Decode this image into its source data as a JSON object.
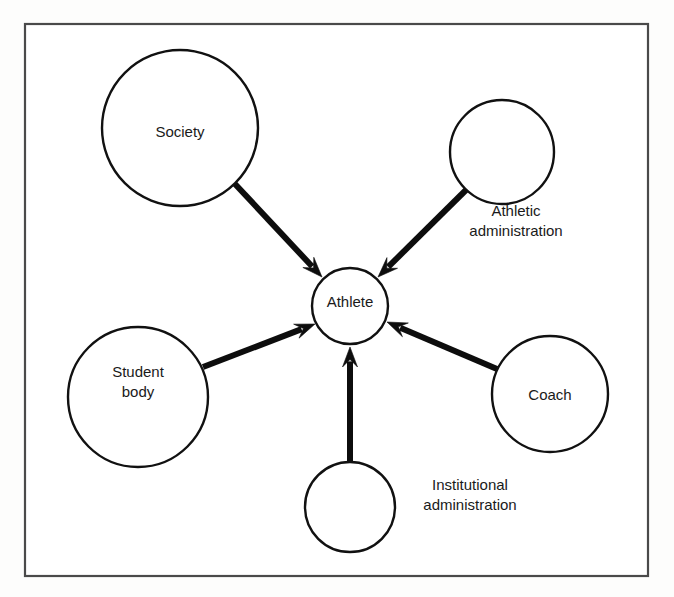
{
  "page": {
    "title": "Athlete Influence Diagram",
    "background_color": "#fdfdfc",
    "width": 674,
    "height": 597
  },
  "frame": {
    "name": "figure-border",
    "x": 25,
    "y": 24,
    "width": 623,
    "height": 552,
    "stroke_color": "#4a4a4a"
  },
  "chart_data": {
    "type": "diagram",
    "subtype": "hub-and-spoke influence diagram",
    "title": "Athlete Influence Diagram",
    "center_node": "Athlete",
    "nodes": [
      {
        "id": "society",
        "label": "Society",
        "label_lines": [
          "Society"
        ],
        "cx": 180,
        "cy": 128,
        "r": 78,
        "label_x": 180,
        "label_y": 133,
        "label_position": "inside"
      },
      {
        "id": "athletic-administration",
        "label": "Athletic administration",
        "label_lines": [
          "Athletic",
          "administration"
        ],
        "cx": 502,
        "cy": 152,
        "r": 52,
        "label_x": 516,
        "label_y": 222,
        "label_position": "outside-below-right"
      },
      {
        "id": "athlete",
        "label": "Athlete",
        "label_lines": [
          "Athlete"
        ],
        "cx": 350,
        "cy": 306,
        "r": 38,
        "label_x": 350,
        "label_y": 303,
        "label_position": "inside"
      },
      {
        "id": "student-body",
        "label": "Student body",
        "label_lines": [
          "Student",
          "body"
        ],
        "cx": 138,
        "cy": 397,
        "r": 70,
        "label_x": 138,
        "label_y": 383,
        "label_position": "inside"
      },
      {
        "id": "coach",
        "label": "Coach",
        "label_lines": [
          "Coach"
        ],
        "cx": 550,
        "cy": 394,
        "r": 58,
        "label_x": 550,
        "label_y": 396,
        "label_position": "inside"
      },
      {
        "id": "institutional-administration",
        "label": "Institutional administration",
        "label_lines": [
          "Institutional",
          "administration"
        ],
        "cx": 350,
        "cy": 507,
        "r": 45,
        "label_x": 470,
        "label_y": 496,
        "label_position": "outside-right"
      }
    ],
    "edges": [
      {
        "id": "society-to-athlete",
        "from": "society",
        "to": "athlete",
        "direction": "to-center",
        "x1": 235,
        "y1": 184,
        "x2": 322,
        "y2": 277
      },
      {
        "id": "athletic-administration-to-athlete",
        "from": "athletic-administration",
        "to": "athlete",
        "direction": "to-center",
        "x1": 466,
        "y1": 190,
        "x2": 378,
        "y2": 277
      },
      {
        "id": "student-body-to-athlete",
        "from": "student-body",
        "to": "athlete",
        "direction": "to-center",
        "x1": 203,
        "y1": 367,
        "x2": 315,
        "y2": 324
      },
      {
        "id": "coach-to-athlete",
        "from": "coach",
        "to": "athlete",
        "direction": "to-center",
        "x1": 497,
        "y1": 369,
        "x2": 387,
        "y2": 322
      },
      {
        "id": "institutional-administration-to-athlete",
        "from": "institutional-administration",
        "to": "athlete",
        "direction": "to-center",
        "x1": 350,
        "y1": 462,
        "x2": 350,
        "y2": 347
      }
    ],
    "styling": {
      "node_fill": "#ffffff",
      "node_stroke": "#111111",
      "arrow_color": "#0d0d0d",
      "text_color": "#1a1a1a",
      "arrow_width": 6,
      "font_size": 15
    }
  }
}
